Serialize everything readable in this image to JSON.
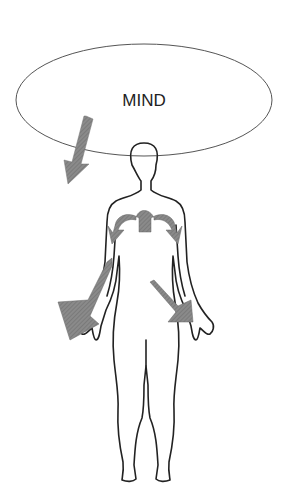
{
  "diagram": {
    "ellipse_label": "MIND",
    "colors": {
      "outline": "#222222",
      "ellipse_stroke": "#555555",
      "arrow_fill": "#7a7a7a",
      "background": "#ffffff"
    },
    "elements": [
      {
        "type": "ellipse",
        "label": "MIND"
      },
      {
        "type": "human-figure"
      },
      {
        "type": "arrow",
        "from": "mind",
        "to": "body",
        "direction": "down-left"
      },
      {
        "type": "arrow",
        "location": "chest",
        "direction": "split-left-right"
      },
      {
        "type": "arrow",
        "location": "right-arm",
        "direction": "down-left"
      },
      {
        "type": "arrow",
        "location": "left-arm",
        "direction": "down-right"
      }
    ]
  }
}
